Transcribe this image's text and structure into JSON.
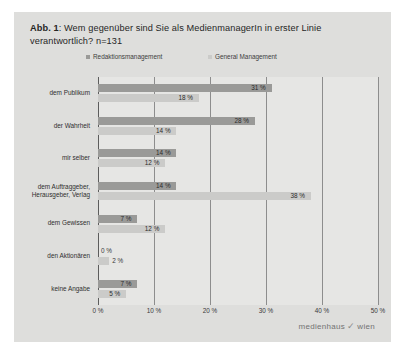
{
  "figure": {
    "label": "Abb. 1",
    "title_prefix": "Abb. 1",
    "title_text": ": Wem gegenüber sind Sie als MedienmanagerIn in erster Linie verantwortlich? n=131",
    "logo_left": "medienhaus",
    "logo_mark": "✓",
    "logo_right": "wien",
    "card_bg": "#dededc",
    "plot_bg": "#e6e6e4"
  },
  "chart_data": {
    "type": "bar",
    "orientation": "horizontal",
    "title": "Abb. 1: Wem gegenüber sind Sie als MedienmanagerIn in erster Linie verantwortlich? n=131",
    "xlabel": "",
    "ylabel": "",
    "xlim": [
      0,
      50
    ],
    "xticks": [
      "0 %",
      "10 %",
      "20 %",
      "30 %",
      "40 %",
      "50 %"
    ],
    "xtick_values": [
      0,
      10,
      20,
      30,
      40,
      50
    ],
    "grid": true,
    "grid_axis": "x",
    "legend_position": "top",
    "categories": [
      "dem Publikum",
      "der Wahrheit",
      "mir selber",
      "dem Auftraggeber, Herausgeber, Verlag",
      "dem Gewissen",
      "den Aktionären",
      "keine Angabe"
    ],
    "category_lines": [
      [
        "dem Publikum"
      ],
      [
        "der Wahrheit"
      ],
      [
        "mir selber"
      ],
      [
        "dem Auftraggeber,",
        "Herausgeber, Verlag"
      ],
      [
        "dem Gewissen"
      ],
      [
        "den Aktionären"
      ],
      [
        "keine Angabe"
      ]
    ],
    "series": [
      {
        "name": "Redaktionsmanagement",
        "color": "#9a9a98",
        "values": [
          31,
          28,
          14,
          14,
          7,
          0,
          7
        ],
        "labels": [
          "31 %",
          "28 %",
          "14 %",
          "14 %",
          "7 %",
          "0 %",
          "7 %"
        ]
      },
      {
        "name": "General Management",
        "color": "#cbcbc9",
        "values": [
          18,
          14,
          12,
          38,
          12,
          2,
          5
        ],
        "labels": [
          "18 %",
          "14 %",
          "12 %",
          "38 %",
          "12 %",
          "2 %",
          "5 %"
        ]
      }
    ]
  }
}
